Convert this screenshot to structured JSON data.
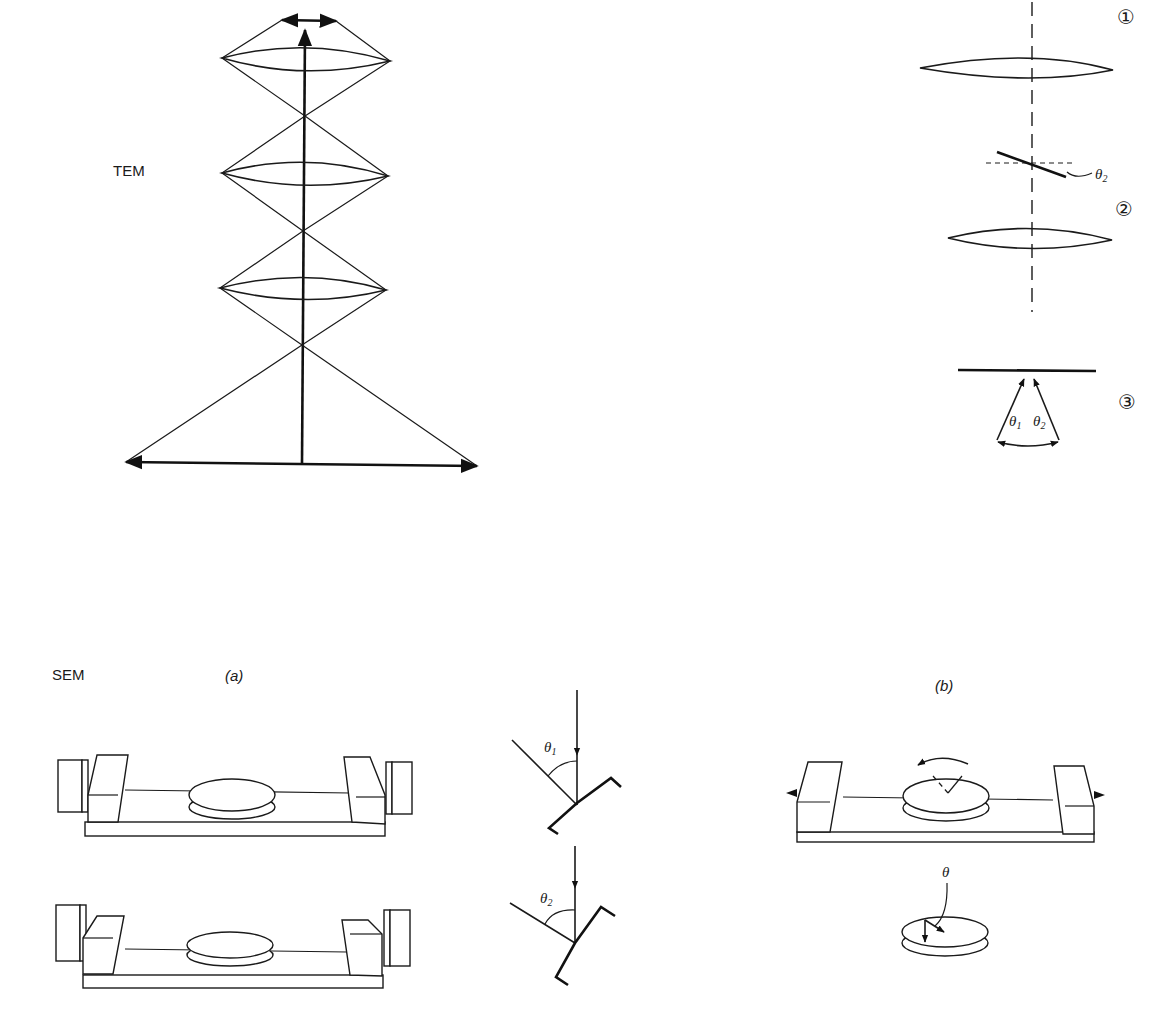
{
  "labels": {
    "tem": "TEM",
    "sem": "SEM",
    "part_a": "(a)",
    "part_b": "(b)"
  },
  "tem_right": {
    "markers": [
      "①",
      "②",
      "③"
    ],
    "theta_tilt": "θ",
    "theta_tilt_sub": "2",
    "theta1": "θ",
    "theta1_sub": "1",
    "theta2": "θ",
    "theta2_sub": "2"
  },
  "sem_a": {
    "theta_top": "θ",
    "theta_top_sub": "1",
    "theta_bottom": "θ",
    "theta_bottom_sub": "2"
  },
  "sem_b": {
    "theta_rot": "θ"
  }
}
